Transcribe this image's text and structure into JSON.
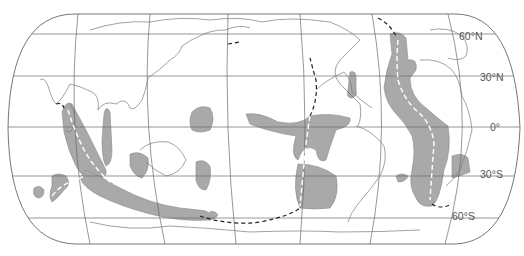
{
  "figure": {
    "type": "world-map",
    "projection": "pseudo-cylindrical (rounded)",
    "colors": {
      "background": "#ffffff",
      "outline": "#666666",
      "graticule": "#6a6a6a",
      "coastline": "#7a7a7a",
      "shaded_region": "#a9a9a9",
      "ridge_dashed": "#ffffff",
      "trench_dashed": "#222222",
      "label": "#555555"
    }
  },
  "latitude_labels": [
    {
      "id": "lat-60n",
      "text": "60°N"
    },
    {
      "id": "lat-30n",
      "text": "30°N"
    },
    {
      "id": "lat-0",
      "text": "0°"
    },
    {
      "id": "lat-30s",
      "text": "30°S"
    },
    {
      "id": "lat-60s",
      "text": "60°S"
    }
  ],
  "legend": {
    "shaded_region": "gray shaded areas",
    "white_dashed_line": "ridge axis",
    "black_dashed_line": "boundary / trench"
  }
}
